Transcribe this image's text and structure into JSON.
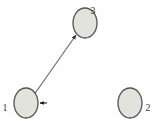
{
  "figure": {
    "type": "graph-diagram",
    "background_color": "#fefefe",
    "width": 157,
    "height": 121
  },
  "graph_data": {
    "type": "directed-graph",
    "node_count": 3,
    "edge_count": 2,
    "nodes": [
      {
        "id": "1",
        "label": "1",
        "cx": 26,
        "cy": 103,
        "rx": 12,
        "ry": 15,
        "fill": "#e3e3dd",
        "stroke": "#54544f",
        "label_x": 5,
        "label_y": 107,
        "label_position": "left"
      },
      {
        "id": "2",
        "label": "2",
        "cx": 130,
        "cy": 103,
        "rx": 12,
        "ry": 15,
        "fill": "#e3e3dd",
        "stroke": "#54544f",
        "label_x": 148,
        "label_y": 107,
        "label_position": "right"
      },
      {
        "id": "3",
        "label": "3",
        "cx": 85,
        "cy": 23,
        "rx": 12,
        "ry": 15,
        "fill": "#e3e3dd",
        "stroke": "#54544f",
        "label_x": 93,
        "label_y": 10,
        "label_position": "top-right"
      }
    ],
    "edges": [
      {
        "id": "edge-1-3",
        "source": "1",
        "target": "3",
        "direction": "bidirectional",
        "color": "#6b6b66",
        "width": 1.2,
        "x1": 36,
        "y1": 92,
        "x2": 76,
        "y2": 35,
        "arrow_at_source": true,
        "arrow_at_target": true
      },
      {
        "id": "edge-2-1",
        "source": "2",
        "target": "1",
        "direction": "unidirectional",
        "gradient": true,
        "gradient_from_color": "#2ad8c8",
        "gradient_mid_color": "#c8e84a",
        "gradient_to_color": "#35d84a",
        "width": 1.4,
        "x1": 118,
        "y1": 103,
        "x2": 40,
        "y2": 103,
        "arrow_at_source": false,
        "arrow_at_target": true,
        "arrow_color": "#1a1a1a"
      }
    ]
  }
}
